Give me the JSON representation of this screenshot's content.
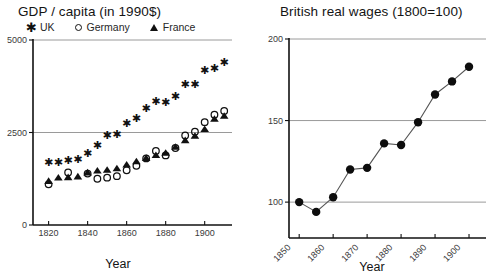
{
  "chart_data": [
    {
      "type": "scatter",
      "title": "GDP  / capita (in 1990$)",
      "xlabel": "Year",
      "ylabel": "",
      "xlim": [
        1812,
        1914
      ],
      "ylim": [
        0,
        5000
      ],
      "xticks": [
        1820,
        1840,
        1860,
        1880,
        1900
      ],
      "yticks": [
        0,
        2500,
        5000
      ],
      "grid": "horizontal gridlines at 2500 and 5000",
      "legend_position": "above plot, horizontal",
      "legend": [
        {
          "name": "UK",
          "marker": "asterisk"
        },
        {
          "name": "Germany",
          "marker": "open-circle"
        },
        {
          "name": "France",
          "marker": "filled-triangle"
        }
      ],
      "series": [
        {
          "name": "UK",
          "marker": "asterisk",
          "x": [
            1820,
            1825,
            1830,
            1835,
            1840,
            1845,
            1850,
            1855,
            1860,
            1865,
            1870,
            1875,
            1880,
            1885,
            1890,
            1895,
            1900,
            1905,
            1910
          ],
          "values": [
            1700,
            1710,
            1760,
            1790,
            1950,
            2150,
            2420,
            2470,
            2750,
            2900,
            3150,
            3350,
            3320,
            3480,
            3800,
            3820,
            4200,
            4250,
            4400
          ]
        },
        {
          "name": "Germany",
          "marker": "open-circle",
          "x": [
            1820,
            1830,
            1840,
            1845,
            1850,
            1855,
            1860,
            1865,
            1870,
            1875,
            1880,
            1885,
            1890,
            1895,
            1900,
            1905,
            1910
          ],
          "values": [
            1100,
            1420,
            1390,
            1250,
            1280,
            1320,
            1480,
            1600,
            1800,
            2000,
            1880,
            2080,
            2420,
            2520,
            2780,
            2980,
            3080
          ]
        },
        {
          "name": "France",
          "marker": "filled-triangle",
          "x": [
            1820,
            1825,
            1830,
            1835,
            1840,
            1845,
            1850,
            1855,
            1860,
            1865,
            1870,
            1875,
            1880,
            1885,
            1890,
            1895,
            1900,
            1905,
            1910
          ],
          "values": [
            1200,
            1290,
            1300,
            1320,
            1430,
            1480,
            1500,
            1540,
            1640,
            1730,
            1820,
            1900,
            1960,
            2120,
            2300,
            2420,
            2600,
            2880,
            2960
          ]
        }
      ]
    },
    {
      "type": "line",
      "title": "British real wages (1800=100)",
      "xlabel": "Year",
      "ylabel": "",
      "xlim": [
        1847,
        1905
      ],
      "ylim": [
        78,
        200
      ],
      "xticks": [
        1850,
        1860,
        1870,
        1880,
        1890,
        1900
      ],
      "yticks": [
        100,
        150,
        200
      ],
      "grid": "horizontal gridlines at 100, 150 and 200",
      "legend_position": "none",
      "series": [
        {
          "name": "British real wages",
          "marker": "filled-circle",
          "x": [
            1850,
            1855,
            1860,
            1865,
            1870,
            1875,
            1880,
            1885,
            1890,
            1895,
            1900
          ],
          "values": [
            100,
            94,
            103,
            120,
            121,
            136,
            135,
            149,
            166,
            174,
            183
          ]
        }
      ]
    }
  ],
  "left_chart": {
    "title": "GDP  / capita (in 1990$)",
    "axis_title_x": "Year",
    "legend": [
      {
        "label": "UK",
        "marker": "asterisk-icon"
      },
      {
        "label": "Germany",
        "marker": "open-circle-icon"
      },
      {
        "label": "France",
        "marker": "filled-triangle-icon"
      }
    ],
    "y_tick_labels": [
      "0",
      "2500",
      "5000"
    ],
    "x_tick_labels": [
      "1820",
      "1840",
      "1860",
      "1880",
      "1900"
    ]
  },
  "right_chart": {
    "title": "British real wages (1800=100)",
    "axis_title_x": "Year",
    "y_tick_labels": [
      "100",
      "150",
      "200"
    ],
    "x_tick_labels": [
      "1850",
      "1860",
      "1870",
      "1880",
      "1890",
      "1900"
    ]
  },
  "colors": {
    "marker": "#111111",
    "gridline": "#9a9a9a",
    "axis": "#111111",
    "background": "#ffffff",
    "text": "#1a1a1a"
  }
}
